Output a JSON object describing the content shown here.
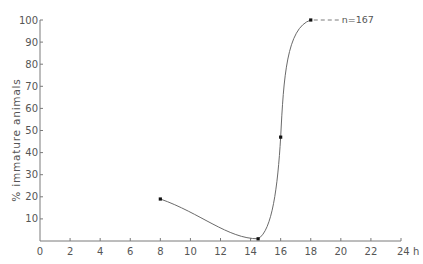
{
  "chart_data": {
    "type": "line",
    "title": "",
    "xlabel": "h",
    "ylabel": "% immature animals",
    "xlim": [
      0,
      24
    ],
    "ylim": [
      0,
      100
    ],
    "x_ticks": [
      0,
      2,
      4,
      6,
      8,
      10,
      12,
      14,
      16,
      18,
      20,
      22,
      24
    ],
    "x_tick_labels": [
      "0",
      "2",
      "4",
      "6",
      "8",
      "10",
      "12",
      "14",
      "16",
      "18",
      "20",
      "22",
      "24 h"
    ],
    "y_ticks": [
      10,
      20,
      30,
      40,
      50,
      60,
      70,
      80,
      90,
      100
    ],
    "y_tick_labels": [
      "10",
      "20",
      "30",
      "40",
      "50",
      "60",
      "70",
      "80",
      "90",
      "100"
    ],
    "grid": false,
    "legend": null,
    "series": [
      {
        "name": "% immature animals",
        "x": [
          8,
          14.5,
          16,
          18
        ],
        "values": [
          19,
          1,
          47,
          100
        ],
        "smooth": true
      }
    ],
    "annotations": [
      {
        "text": "n=167",
        "x": 18,
        "y": 100,
        "style": "dashed leader line to the right of last point"
      }
    ]
  },
  "colors": {
    "axis": "#7a7a7a",
    "line": "#6a6a6a",
    "point": "#111111",
    "text": "#555555",
    "background": "#ffffff"
  }
}
